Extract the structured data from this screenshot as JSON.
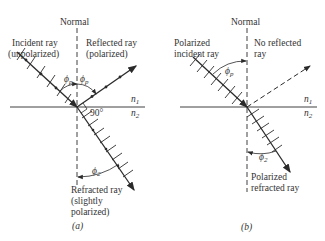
{
  "panel_a": {
    "caption": "(a)",
    "normal_label": "Normal",
    "incident_label_1": "Incident ray",
    "incident_label_2": "(unpolarized)",
    "reflected_label_1": "Reflected ray",
    "reflected_label_2": "(polarized)",
    "refracted_label_1": "Refracted ray",
    "refracted_label_2": "(slightly",
    "refracted_label_3": "polarized)",
    "angle_incident": "ϕ",
    "angle_incident_sub": "p",
    "angle_reflected": "ϕ",
    "angle_reflected_sub": "p",
    "angle_refracted": "ϕ",
    "angle_refracted_sub": "2",
    "right_angle_label": "90°",
    "n1_label": "n",
    "n1_sub": "1",
    "n2_label": "n",
    "n2_sub": "2"
  },
  "panel_b": {
    "caption": "(b)",
    "normal_label": "Normal",
    "incident_label_1": "Polarized",
    "incident_label_2": "incident ray",
    "reflected_label_1": "No reflected",
    "reflected_label_2": "ray",
    "refracted_label_1": "Polarized",
    "refracted_label_2": "refracted ray",
    "angle_incident": "ϕ",
    "angle_incident_sub": "p",
    "angle_refracted": "ϕ",
    "angle_refracted_sub": "2",
    "n1_label": "n",
    "n1_sub": "1",
    "n2_label": "n",
    "n2_sub": "2"
  }
}
